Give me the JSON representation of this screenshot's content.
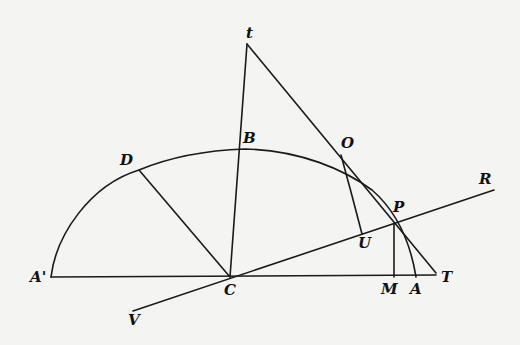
{
  "figure": {
    "type": "geometric-diagram",
    "colors": {
      "background": "#f4f4f2",
      "ink": "#1a1a1a"
    },
    "points": {
      "A_prime": {
        "label": "A'",
        "x": 51,
        "y": 277
      },
      "C": {
        "label": "C",
        "x": 230,
        "y": 277
      },
      "M": {
        "label": "M",
        "x": 394,
        "y": 277
      },
      "A": {
        "label": "A",
        "x": 416,
        "y": 277
      },
      "T": {
        "label": "T",
        "x": 436,
        "y": 272
      },
      "P": {
        "label": "P",
        "x": 394,
        "y": 224
      },
      "t": {
        "label": "t",
        "x": 247,
        "y": 44
      },
      "B": {
        "label": "B",
        "x": 240,
        "y": 149
      },
      "O": {
        "label": "O",
        "x": 341,
        "y": 155
      },
      "U": {
        "label": "U",
        "x": 362,
        "y": 234
      },
      "D": {
        "label": "D",
        "x": 139,
        "y": 170
      },
      "R": {
        "label": "R",
        "x": 494,
        "y": 190
      },
      "V": {
        "label": "V",
        "x": 133,
        "y": 311
      }
    },
    "labels": {
      "t": "t",
      "B": "B",
      "D": "D",
      "O": "O",
      "R": "R",
      "P": "P",
      "U": "U",
      "A_prime": "A'",
      "C": "C",
      "M": "M",
      "A": "A",
      "T": "T",
      "V": "V"
    },
    "segments": [
      {
        "name": "baseline-A'-T",
        "from": "A_prime",
        "to": "T"
      },
      {
        "name": "line-C-t",
        "from": "C",
        "to": "t"
      },
      {
        "name": "tangent-t-T",
        "from": "t",
        "to": "T"
      },
      {
        "name": "line-C-D",
        "from": "C",
        "to": "D"
      },
      {
        "name": "line-V-R",
        "from": "V",
        "to": "R"
      },
      {
        "name": "ordinate-P-M",
        "from": "P",
        "to": "M"
      }
    ],
    "curves": [
      {
        "name": "ellipse-arc-A'-A",
        "through": [
          "A_prime",
          "D",
          "B",
          "P",
          "A"
        ]
      },
      {
        "name": "curve-O-U",
        "through": [
          "O",
          "U"
        ]
      }
    ]
  }
}
